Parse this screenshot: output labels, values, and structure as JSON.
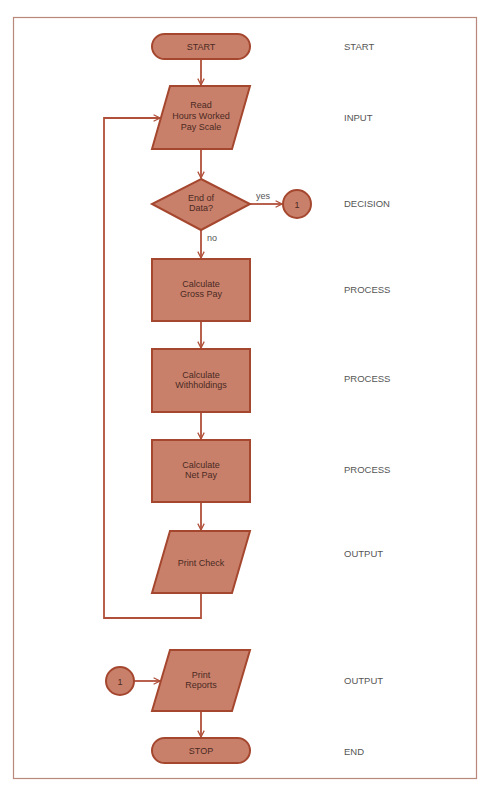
{
  "colors": {
    "frame": "#b8897a",
    "fill": "#c9806b",
    "stroke": "#a5472f",
    "line": "#b0503a",
    "node_text": "#4a2a22",
    "label_text": "#555555"
  },
  "nodes": [
    {
      "id": "start",
      "shape": "terminal",
      "lines": [
        "START"
      ],
      "category": "START"
    },
    {
      "id": "read",
      "shape": "parallelogram",
      "lines": [
        "Read",
        "Hours Worked",
        "Pay Scale"
      ],
      "category": "INPUT"
    },
    {
      "id": "decision",
      "shape": "diamond",
      "lines": [
        "End of",
        "Data?"
      ],
      "category": "DECISION"
    },
    {
      "id": "gross",
      "shape": "rectangle",
      "lines": [
        "Calculate",
        "Gross Pay"
      ],
      "category": "PROCESS"
    },
    {
      "id": "withhold",
      "shape": "rectangle",
      "lines": [
        "Calculate",
        "Withholdings"
      ],
      "category": "PROCESS"
    },
    {
      "id": "net",
      "shape": "rectangle",
      "lines": [
        "Calculate",
        "Net Pay"
      ],
      "category": "PROCESS"
    },
    {
      "id": "check",
      "shape": "parallelogram",
      "lines": [
        "Print Check"
      ],
      "category": "OUTPUT"
    },
    {
      "id": "reports",
      "shape": "parallelogram",
      "lines": [
        "Print",
        "Reports"
      ],
      "category": "OUTPUT"
    },
    {
      "id": "stop",
      "shape": "terminal",
      "lines": [
        "STOP"
      ],
      "category": "END"
    }
  ],
  "connectors": [
    {
      "id": "conn-out",
      "label": "1"
    },
    {
      "id": "conn-in",
      "label": "1"
    }
  ],
  "edge_labels": {
    "yes": "yes",
    "no": "no"
  },
  "edges": [
    {
      "from": "start",
      "to": "read"
    },
    {
      "from": "read",
      "to": "decision"
    },
    {
      "from": "decision",
      "to": "conn-out",
      "label": "yes"
    },
    {
      "from": "decision",
      "to": "gross",
      "label": "no"
    },
    {
      "from": "gross",
      "to": "withhold"
    },
    {
      "from": "withhold",
      "to": "net"
    },
    {
      "from": "net",
      "to": "check"
    },
    {
      "from": "check",
      "to": "read",
      "type": "loop"
    },
    {
      "from": "conn-in",
      "to": "reports"
    },
    {
      "from": "reports",
      "to": "stop"
    }
  ]
}
